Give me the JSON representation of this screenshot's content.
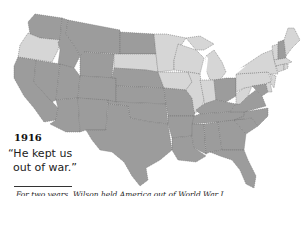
{
  "map": {
    "title_year": "1916",
    "slogan_line1": "“He kept us",
    "slogan_line2": "out of war.”",
    "caption": "For two years, Wilson held America out of World War I",
    "colors": {
      "democratic_wilson": "#9c9c9c",
      "republican_hughes": "#d6d6d6",
      "border": "#6f6f6f",
      "background": "#ffffff"
    },
    "republican_states": [
      "Oregon",
      "South Dakota",
      "Minnesota",
      "Iowa",
      "Wisconsin",
      "Illinois",
      "Indiana",
      "Michigan",
      "Pennsylvania",
      "New York",
      "New Jersey",
      "Connecticut",
      "Rhode Island",
      "Massachusetts",
      "Vermont",
      "Maine",
      "Delaware",
      "West Virginia"
    ],
    "democratic_states": [
      "Washington",
      "California",
      "Idaho",
      "Nevada",
      "Montana",
      "Wyoming",
      "Utah",
      "Arizona",
      "Colorado",
      "New Mexico",
      "North Dakota",
      "Nebraska",
      "Kansas",
      "Oklahoma",
      "Texas",
      "Missouri",
      "Arkansas",
      "Louisiana",
      "Kentucky",
      "Tennessee",
      "Mississippi",
      "Alabama",
      "Georgia",
      "Florida",
      "South Carolina",
      "North Carolina",
      "Virginia",
      "Maryland",
      "Ohio",
      "New Hampshire"
    ]
  }
}
